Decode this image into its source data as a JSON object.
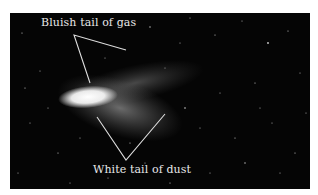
{
  "figure": {
    "annotations": [
      {
        "id": "gas-tail",
        "text": "Bluish tail of gas"
      },
      {
        "id": "dust-tail",
        "text": "White tail of dust"
      }
    ]
  },
  "colors": {
    "background": "#050505",
    "label": "#e8e8e8",
    "line": "#dddddd"
  }
}
